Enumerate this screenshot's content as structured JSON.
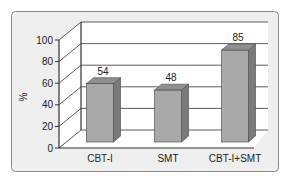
{
  "chart_data": {
    "type": "bar",
    "title": "",
    "xlabel": "",
    "ylabel": "%",
    "ylim": [
      0,
      100
    ],
    "yticks": [
      0,
      20,
      40,
      60,
      80,
      100
    ],
    "categories": [
      "CBT-I",
      "SMT",
      "CBT-I+SMT"
    ],
    "values": [
      54,
      48,
      85
    ],
    "data_labels": [
      "54",
      "48",
      "85"
    ],
    "grid": true,
    "legend": null,
    "style": "3d"
  },
  "colors": {
    "panel_bg": "#eeeeee",
    "panel_border": "#8a8a8a",
    "wall_bg": "#ffffff",
    "bar_front": "#a9a9a9",
    "bar_top": "#8f8f8f",
    "bar_side": "#7a7a7a",
    "axis": "#333333"
  }
}
